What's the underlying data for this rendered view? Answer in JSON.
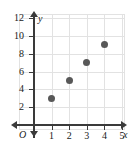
{
  "chart_data": {
    "type": "scatter",
    "title": "",
    "xlabel": "x",
    "ylabel": "y",
    "origin_label": "O",
    "x": [
      1,
      2,
      3,
      4
    ],
    "values": [
      3,
      5,
      7,
      9
    ],
    "points": [
      {
        "x": 1,
        "y": 3
      },
      {
        "x": 2,
        "y": 5
      },
      {
        "x": 3,
        "y": 7
      },
      {
        "x": 4,
        "y": 9
      }
    ],
    "xlim": [
      0,
      5.5
    ],
    "ylim": [
      0,
      13
    ],
    "xticks": [
      1,
      2,
      3,
      4,
      5
    ],
    "yticks": [
      2,
      4,
      6,
      8,
      10,
      12
    ],
    "xtick_labels": [
      "1",
      "2",
      "3",
      "4",
      "5"
    ],
    "ytick_labels": [
      "2",
      "4",
      "6",
      "8",
      "10",
      "12"
    ],
    "grid": true,
    "legend": false,
    "marker_color": "#585858",
    "axis_color": "#3a3a3a",
    "grid_color": "#e2e2e2",
    "background_color": "#ffffff"
  }
}
